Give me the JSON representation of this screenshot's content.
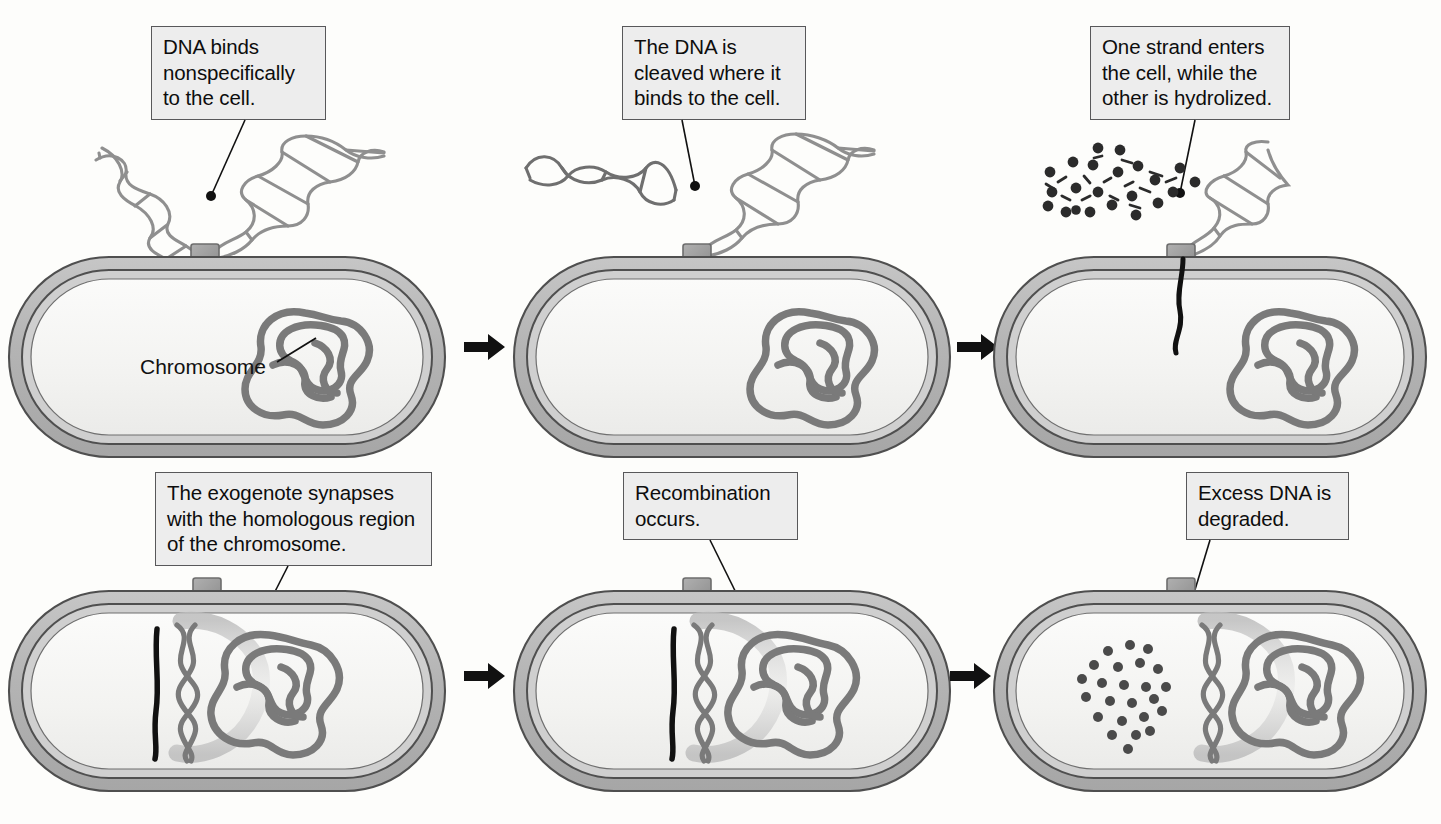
{
  "figure": {
    "background_color": "#fdfdfb"
  },
  "colors": {
    "callout_fill": "#ededed",
    "callout_border": "#58585a",
    "wall_outer": "#b6b6b6",
    "wall_inner": "#c9c9c9",
    "cytoplasm": "#f4f4f2",
    "membrane_line": "#58585a",
    "chromosome": "#7a7a7a",
    "exogenote": "#111111",
    "receptor": "#9a9a9a",
    "dna_helix": "#8f8f8f",
    "fragment": "#2b2b2b",
    "arrow": "#111111",
    "leader": "#111111"
  },
  "steps": [
    {
      "id": "step-1",
      "order": 1,
      "callout": "DNA binds\nnonspecifically\nto the cell.",
      "label": "Chromosome",
      "has_label": true,
      "state": "free double-stranded DNA bound at receptor"
    },
    {
      "id": "step-2",
      "order": 2,
      "callout": "The DNA is\ncleaved where it\nbinds to the cell.",
      "label": "",
      "has_label": false,
      "state": "DNA cleaved, one fragment released"
    },
    {
      "id": "step-3",
      "order": 3,
      "callout": "One strand enters\nthe cell, while the\nother is hydrolized.",
      "label": "",
      "has_label": false,
      "state": "single strand entering, other strand hydrolyzed to fragments"
    },
    {
      "id": "step-4",
      "order": 4,
      "callout": "The exogenote synapses\nwith the homologous region\nof the chromosome.",
      "label": "",
      "has_label": false,
      "state": "exogenote aligned with homologous chromosome region"
    },
    {
      "id": "step-5",
      "order": 5,
      "callout": "Recombination\noccurs.",
      "label": "",
      "has_label": false,
      "state": "strand exchange / recombination"
    },
    {
      "id": "step-6",
      "order": 6,
      "callout": "Excess DNA is\ndegraded.",
      "label": "",
      "has_label": false,
      "state": "excess DNA degraded into fragments inside cell"
    }
  ],
  "arrows": [
    {
      "id": "arrow-1-2",
      "from": "step-1",
      "to": "step-2",
      "direction": "right"
    },
    {
      "id": "arrow-2-3",
      "from": "step-2",
      "to": "step-3",
      "direction": "right"
    },
    {
      "id": "arrow-4-5",
      "from": "step-4",
      "to": "step-5",
      "direction": "right"
    },
    {
      "id": "arrow-5-6",
      "from": "step-5",
      "to": "step-6",
      "direction": "right"
    }
  ]
}
